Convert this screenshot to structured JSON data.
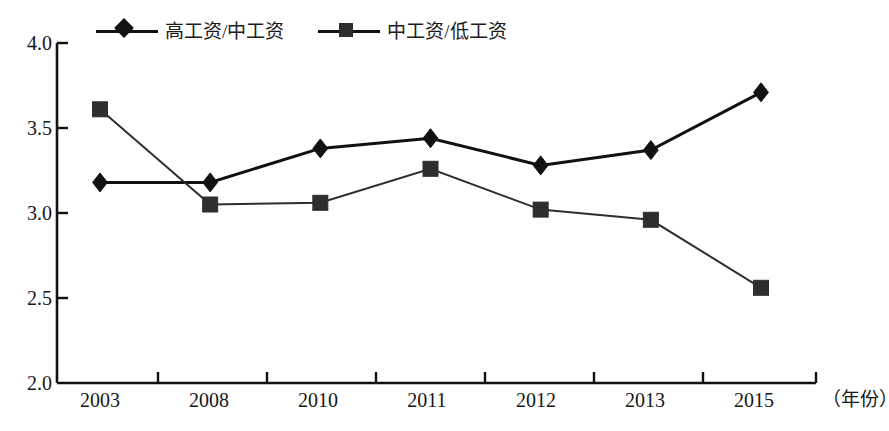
{
  "page": {
    "clipped_top_text": "",
    "background": "#ffffff"
  },
  "legend": {
    "position": "top",
    "entries": [
      {
        "label": "高工资/中工资",
        "marker": "diamond-marker",
        "color": "#111111"
      },
      {
        "label": "中工资/低工资",
        "marker": "square-marker",
        "color": "#2e2e2e"
      }
    ]
  },
  "axes": {
    "y_ticks": [
      "4.0",
      "3.5",
      "3.0",
      "2.5",
      "2.0"
    ],
    "x_unit_label": "（年份）"
  },
  "chart_data": {
    "type": "line",
    "title": "",
    "subtitle": "",
    "xlabel": "（年份）",
    "ylabel": "",
    "categories": [
      "2003",
      "2008",
      "2010",
      "2011",
      "2012",
      "2013",
      "2015"
    ],
    "ylim": [
      2.0,
      4.0
    ],
    "ytick_values": [
      4.0,
      3.5,
      3.0,
      2.5,
      2.0
    ],
    "grid": false,
    "legend_position": "top",
    "series": [
      {
        "name": "高工资/中工资",
        "marker": "diamond",
        "color": "#111111",
        "values": [
          3.18,
          3.18,
          3.38,
          3.44,
          3.28,
          3.37,
          3.71
        ]
      },
      {
        "name": "中工资/低工资",
        "marker": "square",
        "color": "#2e2e2e",
        "values": [
          3.61,
          3.05,
          3.06,
          3.26,
          3.02,
          2.96,
          2.56
        ]
      }
    ]
  }
}
